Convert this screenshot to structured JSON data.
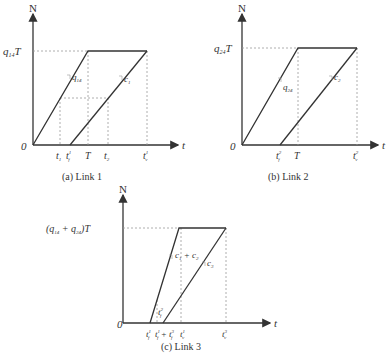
{
  "panels": [
    {
      "id": "a",
      "caption": "(a) Link 1",
      "y_axis_label": "N",
      "x_axis_label": "t",
      "origin_label": "0",
      "level_label_main": "q",
      "level_label_sub": "14",
      "level_label_suffix": "T",
      "slope_labels": [
        {
          "main": "q",
          "sub": "14"
        },
        {
          "main": "c",
          "sub": "1"
        }
      ],
      "ticks": [
        {
          "main": "t",
          "sub": "1"
        },
        {
          "main": "t",
          "sup": "1",
          "sub": "f"
        },
        {
          "main": "T"
        },
        {
          "main": "t",
          "sub": "2"
        },
        {
          "main": "t",
          "sup": "1",
          "sub": "v"
        }
      ]
    },
    {
      "id": "b",
      "caption": "(b) Link 2",
      "y_axis_label": "N",
      "x_axis_label": "t",
      "origin_label": "0",
      "level_label_main": "q",
      "level_label_sub": "24",
      "level_label_suffix": "T",
      "slope_labels": [
        {
          "main": "q",
          "sub": "24"
        },
        {
          "main": "c",
          "sub": "2"
        }
      ],
      "ticks": [
        {
          "main": "t",
          "sup": "2",
          "sub": "f"
        },
        {
          "main": "T"
        },
        {
          "main": "t",
          "sup": "2",
          "sub": "v"
        }
      ]
    },
    {
      "id": "c",
      "caption": "(c) Link 3",
      "y_axis_label": "N",
      "x_axis_label": "t",
      "origin_label": "0",
      "level_label": "(q14 + q24)T",
      "level_label_parts": {
        "open": "(",
        "q1": "q",
        "s1": "14",
        "plus": " + ",
        "q2": "q",
        "s2": "24",
        "close": ")T"
      },
      "slope_labels": [
        {
          "main": "c",
          "sub": "1",
          "extra": " + c",
          "extra_sub": "2"
        },
        {
          "main": "c",
          "sub": "3"
        }
      ],
      "inner_label": {
        "main": "t",
        "sub": "f",
        "sup": "2"
      },
      "ticks": [
        {
          "main": "t",
          "sup": "1",
          "sub": "f"
        },
        {
          "main": "t",
          "sup": "1",
          "sub": "f",
          "plus": " + ",
          "main2": "t",
          "sup2": "3",
          "sub2": "f"
        },
        {
          "main": "t",
          "sup": "1",
          "sub": "v"
        },
        {
          "main": "t",
          "sup": "3",
          "sub": "v"
        }
      ]
    }
  ]
}
